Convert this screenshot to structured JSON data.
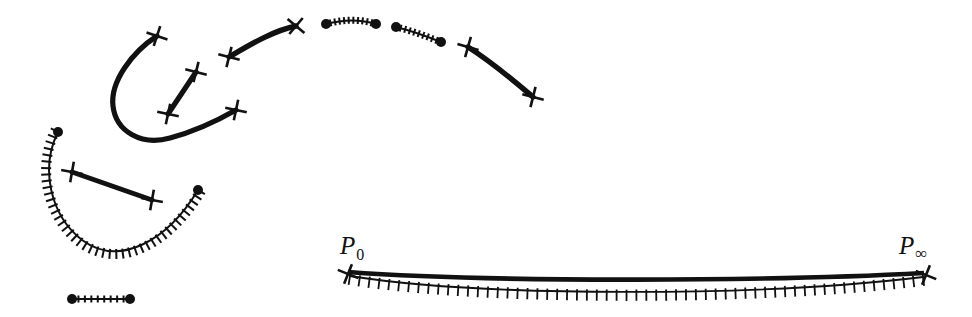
{
  "figure": {
    "background_color": "#ffffff",
    "ink_color": "#111111",
    "width": 972,
    "height": 317,
    "labels": [
      {
        "name": "p-zero-label",
        "base": "P",
        "sub": "0",
        "x": 340,
        "y": 233,
        "sub_kind": "digit"
      },
      {
        "name": "p-infinity-label",
        "base": "P",
        "sub": "∞",
        "x": 899,
        "y": 233,
        "sub_kind": "infinity"
      }
    ],
    "thick_curves": [
      {
        "name": "large-u-curve",
        "path": "M 157,36 C 132,52 110,82 113,106 C 116,132 142,146 170,138 C 200,130 222,118 236,110",
        "width": 5.2,
        "start_marker": "cross",
        "end_marker": "cross",
        "start_marker_angle": 18,
        "end_marker_angle": 12
      },
      {
        "name": "short-diagonal-segment",
        "path": "M 168,114 L 196,72",
        "width": 5.2,
        "start_marker": "cross",
        "end_marker": "cross",
        "start_marker_angle": 12,
        "end_marker_angle": 14
      },
      {
        "name": "upper-long-arc",
        "path": "M 229,57 C 248,46 272,31 296,26",
        "width": 5.4,
        "start_marker": "cross",
        "end_marker": "cross-x",
        "start_marker_angle": 14,
        "end_marker_angle": 40
      },
      {
        "name": "right-descending-arc",
        "path": "M 468,47 C 492,62 513,80 533,97",
        "width": 5.4,
        "start_marker": "cross",
        "end_marker": "cross",
        "start_marker_angle": 16,
        "end_marker_angle": 14
      },
      {
        "name": "left-straight-chord",
        "path": "M 72,172 L 152,200",
        "width": 5.0,
        "start_marker": "cross",
        "end_marker": "cross",
        "start_marker_angle": 10,
        "end_marker_angle": 10
      }
    ],
    "hatched_curves": [
      {
        "name": "left-hatched-u-arc",
        "path": "M 58,132 C 40,168 50,215 82,240 C 120,268 168,240 198,190",
        "tick_count": 42,
        "tick_length": 8,
        "tick_side": "outside",
        "stroke_width": 2.0,
        "start_endpoint": "dot",
        "end_endpoint": "dot",
        "dot_radius": 5
      },
      {
        "name": "bottom-left-hatched-segment",
        "path": "M 72,299 L 130,299",
        "tick_count": 9,
        "tick_length": 7,
        "tick_side": "both",
        "stroke_width": 2.0,
        "start_endpoint": "dot",
        "end_endpoint": "dot",
        "dot_radius": 5
      },
      {
        "name": "top-middle-hatched-segment-a",
        "path": "M 326,24 C 345,19 360,19 376,24",
        "tick_count": 11,
        "tick_length": 7,
        "tick_side": "both",
        "stroke_width": 2.0,
        "start_endpoint": "dot",
        "end_endpoint": "dot",
        "dot_radius": 5
      },
      {
        "name": "top-middle-hatched-segment-b",
        "path": "M 396,27 C 412,31 426,36 441,42",
        "tick_count": 10,
        "tick_length": 7,
        "tick_side": "both",
        "stroke_width": 2.0,
        "start_endpoint": "dot",
        "end_endpoint": "dot",
        "dot_radius": 5
      },
      {
        "name": "bottom-long-hatched-curve",
        "path": "M 350,276 C 480,297 760,297 923,277",
        "tick_count": 58,
        "tick_length": 9,
        "tick_side": "outside",
        "stroke_width": 1.8,
        "start_endpoint": "none",
        "end_endpoint": "none",
        "dot_radius": 0
      }
    ],
    "lens_top_curve": {
      "name": "bottom-long-thick-curve",
      "path": "M 348,272 C 480,282 760,282 924,273",
      "width": 4.6,
      "start_marker": "cross-x",
      "end_marker": "cross-x",
      "start_marker_angle": 22,
      "end_marker_angle": 22
    }
  }
}
